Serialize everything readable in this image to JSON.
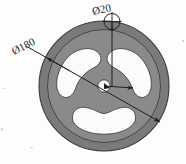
{
  "document": {
    "kind": "technical-drawing",
    "title": "Flywheel disc front view",
    "background_color": "#fdfdfd"
  },
  "colors": {
    "disc_body": "#878787",
    "disc_rim": "#7a7a7a",
    "cutout_fill": "#fbfbfb",
    "outline": "#2b2b2b",
    "dimension_line": "#1e1e1e",
    "text": "#232323",
    "hub_fill": "#fafafa"
  },
  "part": {
    "name": "flywheel-disc",
    "outer_diameter_label": "Ø180",
    "hole_diameter_label": "Ø20",
    "cutout_count": 3,
    "cutout_spacing_degrees": 120,
    "center_hub_label": ""
  },
  "dimensions": [
    {
      "id": "outer-diameter",
      "label": "Ø180",
      "type": "diameter",
      "value": 180,
      "orientation": "diagonal",
      "arrow_ends": "both",
      "label_rotation_degrees": -27
    },
    {
      "id": "hole-diameter",
      "label": "Ø20",
      "type": "diameter",
      "value": 20,
      "orientation": "vertical-leader",
      "arrow_ends": "one",
      "label_rotation_degrees": -12
    }
  ],
  "annotations": {
    "center_mark": "crosshair-circle",
    "center_leader_arrow": "right-pointing-arrow"
  },
  "caption": {
    "text": "",
    "visible": false
  }
}
